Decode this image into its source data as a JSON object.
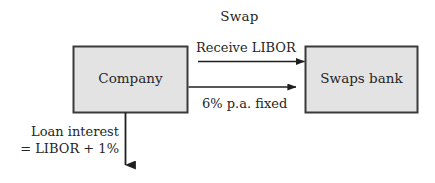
{
  "diagram": {
    "title": "Swap",
    "nodes": [
      {
        "id": "company",
        "label": "Company",
        "fill": "#e3e3e3",
        "stroke": "#3a3a3a"
      },
      {
        "id": "swaps_bank",
        "label": "Swaps bank",
        "fill": "#e3e3e3",
        "stroke": "#3a3a3a"
      }
    ],
    "edges": [
      {
        "id": "receive_libor",
        "label": "Receive LIBOR",
        "from": "swaps_bank",
        "to": "company",
        "direction": "left",
        "label_position": "above"
      },
      {
        "id": "fixed_rate",
        "label": "6% p.a. fixed",
        "from": "company",
        "to": "swaps_bank",
        "direction": "right",
        "label_position": "below"
      },
      {
        "id": "loan_interest",
        "label_line_1": "Loan interest",
        "label_line_2": "= LIBOR + 1%",
        "from": "company",
        "to": "",
        "direction": "down",
        "label_position": "left"
      }
    ],
    "colors": {
      "box_fill": "#e3e3e3",
      "box_stroke": "#3a3a3a",
      "arrow": "#1f1f1f",
      "text": "#262626",
      "background": "#ffffff"
    }
  }
}
